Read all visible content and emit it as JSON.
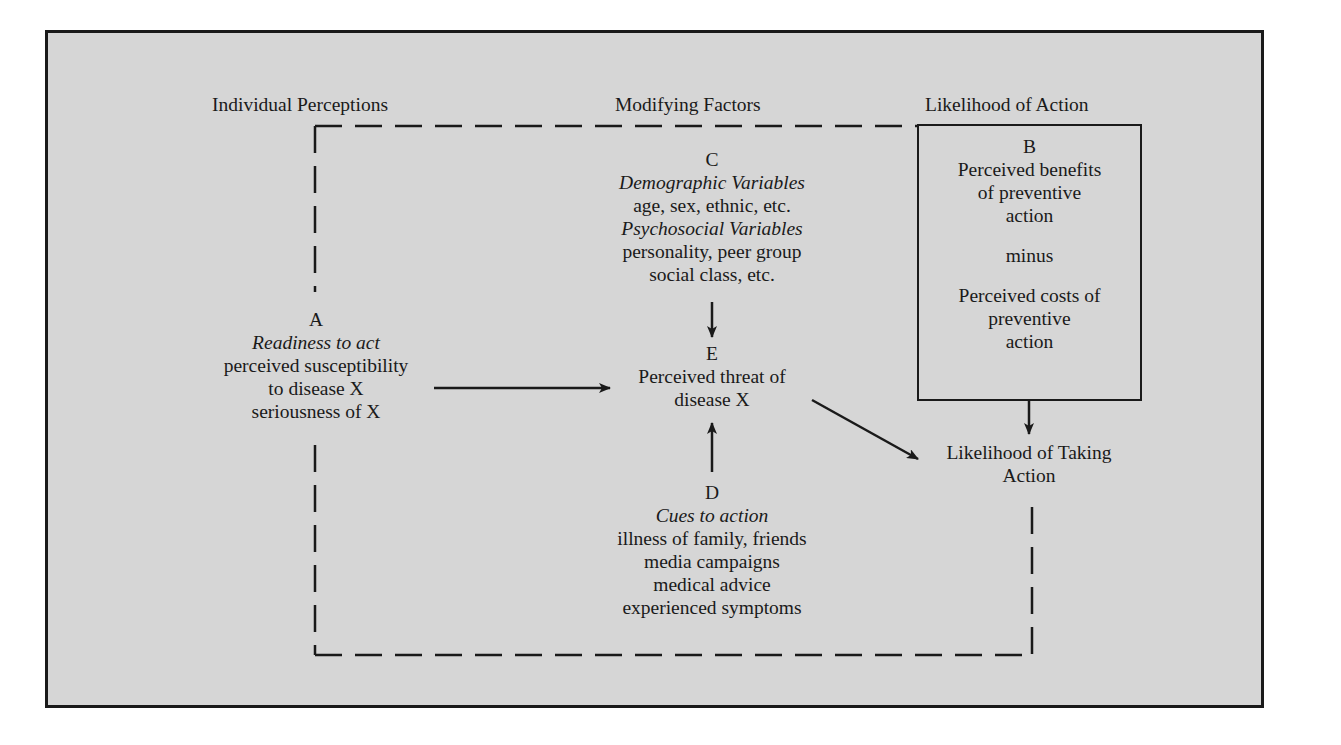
{
  "headers": {
    "individual": "Individual Perceptions",
    "modifying": "Modifying Factors",
    "likelihood": "Likelihood of Action"
  },
  "nodes": {
    "A": {
      "letter": "A",
      "title": "Readiness to act",
      "lines": [
        "perceived susceptibility",
        "to disease X",
        "seriousness of X"
      ]
    },
    "B": {
      "letter": "B",
      "lines_top": [
        "Perceived benefits",
        "of preventive",
        "action"
      ],
      "operator": "minus",
      "lines_bottom": [
        "Perceived costs of",
        "preventive",
        "action"
      ]
    },
    "C": {
      "letter": "C",
      "title1": "Demographic Variables",
      "line1": "age, sex, ethnic, etc.",
      "title2": "Psychosocial Variables",
      "line2": "personality, peer group",
      "line3": "social class, etc."
    },
    "D": {
      "letter": "D",
      "title": "Cues to action",
      "lines": [
        "illness of family, friends",
        "media campaigns",
        "medical advice",
        "experienced symptoms"
      ]
    },
    "E": {
      "letter": "E",
      "lines": [
        "Perceived threat of",
        "disease X"
      ]
    },
    "outcome": {
      "lines": [
        "Likelihood of Taking",
        "Action"
      ]
    }
  },
  "edges": [
    {
      "from": "A",
      "to": "E",
      "style": "solid-arrow"
    },
    {
      "from": "C",
      "to": "E",
      "style": "solid-arrow"
    },
    {
      "from": "D",
      "to": "E",
      "style": "solid-arrow"
    },
    {
      "from": "E",
      "to": "outcome",
      "style": "solid-arrow"
    },
    {
      "from": "B",
      "to": "outcome",
      "style": "solid-arrow"
    }
  ],
  "colors": {
    "background": "#d6d6d6",
    "ink": "#1a1a1a"
  }
}
